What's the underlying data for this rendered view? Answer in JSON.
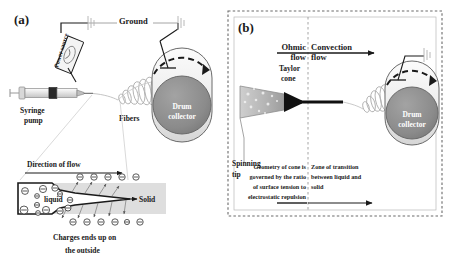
{
  "figure": {
    "type": "schematic-diagram",
    "panels": [
      {
        "tag": "(a)",
        "name": "electrospinning-apparatus-overview",
        "labels": {
          "ground": "Ground",
          "power_source": "Power source",
          "syringe_pump_line1": "Syringe",
          "syringe_pump_line2": "pump",
          "fibers": "Fibers",
          "drum_line1": "Drum",
          "drum_line2": "collector"
        },
        "inset": {
          "name": "charge-distribution-inset",
          "direction_of_flow": "Direction of flow",
          "liquid": "liquid",
          "solid": "Solid",
          "caption_line1": "Charges ends up on",
          "caption_line2": "the outside",
          "charge_glyph": "⊖",
          "top_charge_count": 5,
          "bottom_charge_count": 6,
          "inner_charge_count": 10
        }
      },
      {
        "tag": "(b)",
        "name": "jet-regions-detail",
        "labels": {
          "ohmic_flow_line1": "Ohmic",
          "ohmic_flow_line2": "flow",
          "convection_flow_line1": "Convection",
          "convection_flow_line2": "flow",
          "taylor_cone_line1": "Taylor",
          "taylor_cone_line2": "cone",
          "spinning_tip_line1": "Spinning",
          "spinning_tip_line2": "tip",
          "drum_line1": "Drum",
          "drum_line2": "collector"
        },
        "notes": {
          "left_note": [
            "Geometry of cone is",
            "governed by the ratio",
            "of surface tension to",
            "electrostatic repulsion"
          ],
          "right_note": [
            "Zone of transition",
            "between liquid and",
            "solid"
          ]
        }
      }
    ],
    "colors": {
      "ink": "#1a1a1a",
      "drum_face": "#8a8a8a",
      "drum_body": "#e8e8e8",
      "inset_solid_zone": "#dedede",
      "taylor_cone": "#111111",
      "tip_fill": "#b9b9b9",
      "panel_border": "#555555"
    }
  }
}
